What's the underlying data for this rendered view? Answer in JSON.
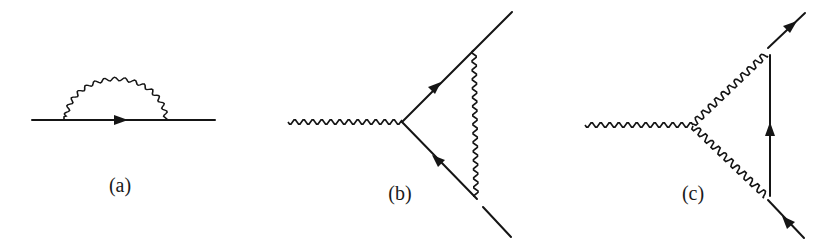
{
  "figure": {
    "panels": [
      {
        "id": "a",
        "label": "(a)",
        "description": "Electron self-energy: fermion line with photon loop",
        "fermion_lines": 1,
        "photon_lines": 1
      },
      {
        "id": "b",
        "label": "(b)",
        "description": "Vertex correction: external photon, fermion triangle with internal photon exchange",
        "fermion_lines": 2,
        "photon_lines": 2
      },
      {
        "id": "c",
        "label": "(c)",
        "description": "Vertex with two internal photon lines and internal fermion line",
        "fermion_lines": 3,
        "photon_lines": 3
      }
    ],
    "colors": {
      "ink": "#151515",
      "background": "#ffffff"
    }
  }
}
